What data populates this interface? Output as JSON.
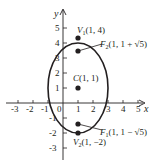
{
  "diagram": {
    "type": "ellipse-graph",
    "axes": {
      "x_label": "x",
      "y_label": "y",
      "x_ticks": [
        "-3",
        "-2",
        "-1",
        "0",
        "1",
        "2",
        "3",
        "4",
        "5"
      ],
      "y_ticks": [
        "5",
        "4",
        "3",
        "2",
        "1",
        "-1",
        "-2",
        "-3"
      ],
      "origin_label": "0"
    },
    "ellipse": {
      "center": [
        1,
        1
      ],
      "semi_major": 3,
      "semi_minor": 2,
      "orientation": "vertical"
    },
    "points": [
      {
        "id": "V1",
        "label_main": "V",
        "label_sub": "1",
        "label_coords": "(1, 4)",
        "x": 1,
        "y": 4
      },
      {
        "id": "F2",
        "label_main": "F",
        "label_sub": "2",
        "label_coords": "(1, 1 + √5)",
        "x": 1,
        "y": 3.236
      },
      {
        "id": "C",
        "label_main": "C",
        "label_sub": "",
        "label_coords": "(1, 1)",
        "x": 1,
        "y": 1
      },
      {
        "id": "F1",
        "label_main": "F",
        "label_sub": "1",
        "label_coords": "(1, 1 − √5)",
        "x": 1,
        "y": -1.236
      },
      {
        "id": "V2",
        "label_main": "V",
        "label_sub": "2",
        "label_coords": "(1, −2)",
        "x": 1,
        "y": -2
      }
    ],
    "colors": {
      "ink": "#231f20",
      "background": "#ffffff"
    }
  }
}
